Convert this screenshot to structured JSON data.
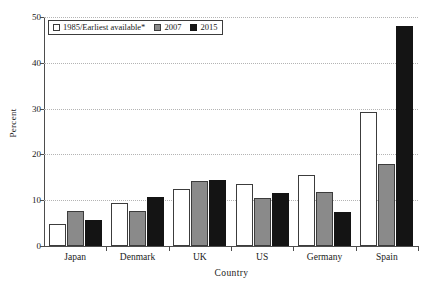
{
  "chart_data": {
    "type": "bar",
    "title": "",
    "xlabel": "Country",
    "ylabel": "Percent",
    "categories": [
      "Japan",
      "Denmark",
      "UK",
      "US",
      "Germany",
      "Spain"
    ],
    "series": [
      {
        "name": "1985/Earliest available*",
        "color": "#ffffff",
        "values": [
          4.9,
          9.5,
          12.5,
          13.5,
          15.5,
          29.3
        ]
      },
      {
        "name": "2007",
        "color": "#8a8a8a",
        "values": [
          7.7,
          7.6,
          14.1,
          10.5,
          11.9,
          18.0
        ]
      },
      {
        "name": "2015",
        "color": "#141414",
        "values": [
          5.6,
          10.8,
          14.5,
          11.5,
          7.4,
          48.1
        ]
      }
    ],
    "ylim": [
      0,
      50
    ],
    "yticks": [
      0,
      10,
      20,
      30,
      40,
      50
    ],
    "ytick_labels": [
      "0",
      "10",
      "20",
      "30",
      "40",
      "50"
    ],
    "grid": true,
    "grid_style": "dotted-horizontal",
    "legend_position": "top-left-inside",
    "axis_color": "#4d4d4d",
    "grid_color": "#b4b4b4"
  },
  "legend": {
    "items": [
      {
        "label": "1985/Earliest available*"
      },
      {
        "label": "2007"
      },
      {
        "label": "2015"
      }
    ]
  }
}
